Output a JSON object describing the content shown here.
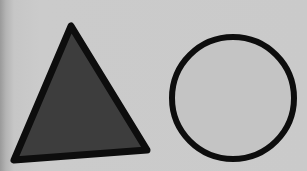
{
  "scene": {
    "background_color": "#c9c9c9",
    "shapes": [
      {
        "type": "triangle",
        "points": "71,26 14,160 147,150",
        "fill": "#3d3d3d",
        "stroke": "#0d0d0d",
        "stroke_width": 7
      },
      {
        "type": "circle",
        "cx": 233,
        "cy": 98,
        "r": 61,
        "fill": "#c4c4c4",
        "stroke": "#0d0d0d",
        "stroke_width": 6
      }
    ]
  }
}
